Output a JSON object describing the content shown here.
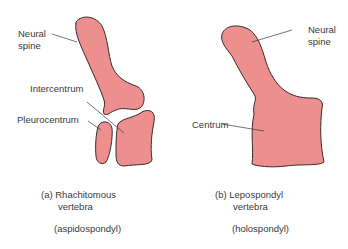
{
  "colors": {
    "bone_fill": "#ec8f8e",
    "outline": "#3a2a2a",
    "text": "#3a3a3a"
  },
  "panel_a": {
    "labels": {
      "neural_spine_line1": "Neural",
      "neural_spine_line2": "spine",
      "intercentrum": "Intercentrum",
      "pleurocentrum": "Pleurocentrum"
    },
    "caption_line1": "(a) Rhachitomous",
    "caption_line2": "vertebra",
    "caption_sub": "(aspidospondyl)"
  },
  "panel_b": {
    "labels": {
      "neural_spine_line1": "Neural",
      "neural_spine_line2": "spine",
      "centrum": "Centrum"
    },
    "caption_line1": "(b) Lepospondyl",
    "caption_line2": "vertebra",
    "caption_sub": "(holospondyl)"
  }
}
